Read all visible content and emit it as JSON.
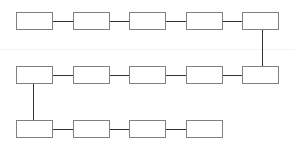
{
  "diagram": {
    "type": "serpentine-flow",
    "colors": {
      "node_border": "#808080",
      "connector": "#333333",
      "background": "#ffffff"
    },
    "node_size": {
      "w": 37,
      "h": 18
    },
    "rows": [
      {
        "y": 12,
        "nodes": [
          16,
          73,
          129,
          186,
          242
        ]
      },
      {
        "y": 66,
        "nodes": [
          16,
          73,
          129,
          186,
          242
        ]
      },
      {
        "y": 120,
        "nodes": [
          16,
          73,
          129,
          186
        ]
      }
    ],
    "vertical_links": [
      {
        "x": 262,
        "from_row": 0,
        "to_row": 1
      },
      {
        "x": 33,
        "from_row": 1,
        "to_row": 2
      }
    ],
    "node_labels": []
  }
}
